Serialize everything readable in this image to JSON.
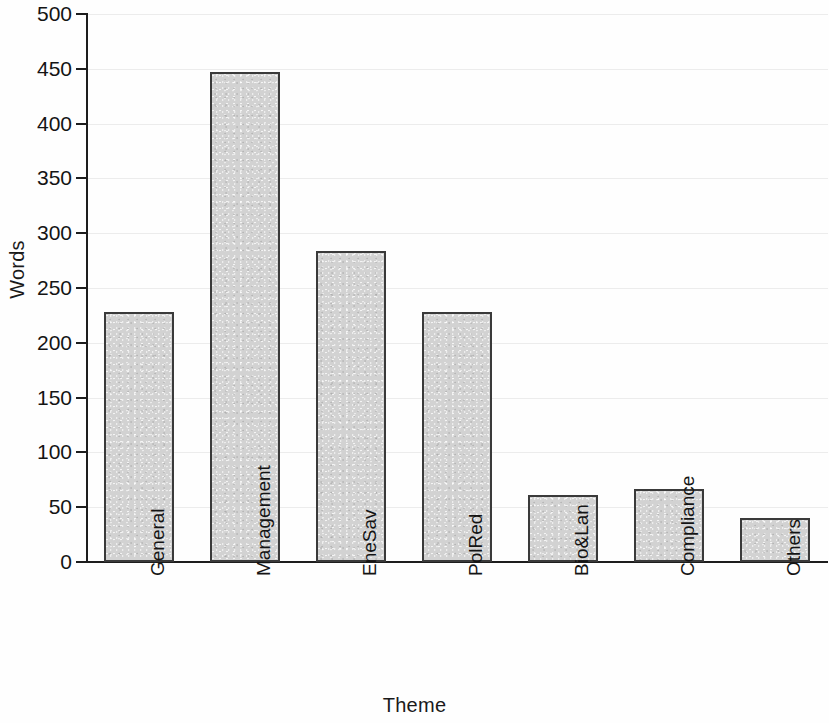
{
  "chart_data": {
    "type": "bar",
    "title": "",
    "xlabel": "Theme",
    "ylabel": "Words",
    "categories": [
      "General",
      "Management",
      "EneSav",
      "PolRed",
      "Bio&Lan",
      "Compliance",
      "Others"
    ],
    "values": [
      228,
      447,
      284,
      228,
      61,
      67,
      40
    ],
    "ylim": [
      0,
      500
    ],
    "ytick_labels": [
      "0",
      "50",
      "100",
      "150",
      "200",
      "250",
      "300",
      "350",
      "400",
      "450",
      "500"
    ],
    "ytick_values": [
      0,
      50,
      100,
      150,
      200,
      250,
      300,
      350,
      400,
      450,
      500
    ],
    "grid": true,
    "legend": false,
    "bar_fill_color": "#d2d2d2",
    "bar_edge_color": "#3a3a3a",
    "background_color": "#ffffff",
    "gridline_color": "#ebebeb"
  }
}
